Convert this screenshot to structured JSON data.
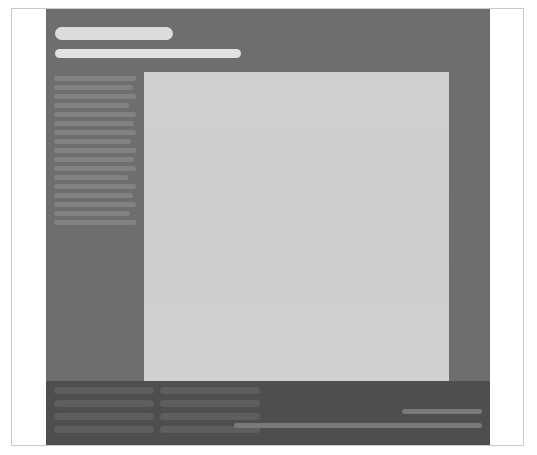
{
  "meta": {
    "screen_width": 537,
    "screen_height": 455,
    "state": "loading"
  },
  "colors": {
    "page_background": "#ffffff",
    "frame_border": "#c9c9c9",
    "shell_background": "#6e6e6e",
    "footer_background": "#4e4e4e",
    "panel_background": "#cfcfcf",
    "header_skeleton_primary": "#dcdcdc",
    "header_skeleton_secondary": "#e2e2e2",
    "sidebar_skeleton": "#828282",
    "footer_skeleton": "#5e5e5e",
    "footer_meta_skeleton": "#7a7a7a"
  },
  "header": {
    "title_placeholder": "",
    "subtitle_placeholder": "",
    "title_width": 118,
    "subtitle_width": 186
  },
  "sidebar": {
    "items": [
      {
        "label": "",
        "width": "100%"
      },
      {
        "label": "",
        "width": "96%"
      },
      {
        "label": "",
        "width": "100%"
      },
      {
        "label": "",
        "width": "92%"
      },
      {
        "label": "",
        "width": "100%"
      },
      {
        "label": "",
        "width": "98%"
      },
      {
        "label": "",
        "width": "100%"
      },
      {
        "label": "",
        "width": "94%"
      },
      {
        "label": "",
        "width": "100%"
      },
      {
        "label": "",
        "width": "97%"
      },
      {
        "label": "",
        "width": "100%"
      },
      {
        "label": "",
        "width": "90%"
      },
      {
        "label": "",
        "width": "100%"
      },
      {
        "label": "",
        "width": "96%"
      },
      {
        "label": "",
        "width": "100%"
      },
      {
        "label": "",
        "width": "93%"
      },
      {
        "label": "",
        "width": "100%"
      }
    ]
  },
  "main": {
    "content_placeholder": "",
    "width": 305,
    "height": 309
  },
  "footer": {
    "column_one": [
      {
        "label": "",
        "width": "100%"
      },
      {
        "label": "",
        "width": "100%"
      },
      {
        "label": "",
        "width": "100%"
      },
      {
        "label": "",
        "width": "100%"
      }
    ],
    "column_two": [
      {
        "label": "",
        "width": "100%"
      },
      {
        "label": "",
        "width": "100%"
      },
      {
        "label": "",
        "width": "100%"
      },
      {
        "label": "",
        "width": "100%"
      }
    ],
    "meta_short_label": "",
    "meta_long_label": ""
  }
}
